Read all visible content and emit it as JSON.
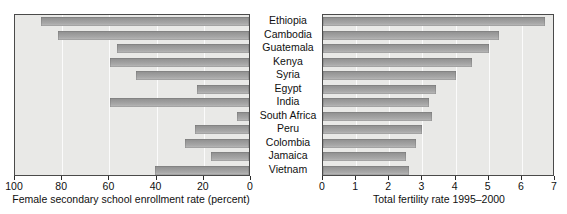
{
  "chart_data": [
    {
      "type": "bar",
      "orientation": "horizontal",
      "id": "female-enrollment",
      "title": "",
      "xlabel": "Female secondary school enrollment rate (percent)",
      "ylabel": "",
      "xlim": [
        100,
        0
      ],
      "reversed_x": true,
      "grid": true,
      "legend": "none",
      "xticks": [
        100,
        80,
        60,
        40,
        20,
        0
      ],
      "xticklabels": [
        "100",
        "80",
        "60",
        "40",
        "20",
        "0"
      ],
      "categories": [
        "Ethiopia",
        "Cambodia",
        "Guatemala",
        "Kenya",
        "Syria",
        "Egypt",
        "India",
        "South Africa",
        "Peru",
        "Colombia",
        "Jamaica",
        "Vietnam"
      ],
      "values": [
        12,
        19,
        44,
        41,
        52,
        78,
        41,
        95,
        77,
        73,
        84,
        60
      ]
    },
    {
      "type": "bar",
      "orientation": "horizontal",
      "id": "total-fertility",
      "title": "",
      "xlabel": "Total fertility rate 1995–2000",
      "ylabel": "",
      "xlim": [
        0,
        7
      ],
      "reversed_x": false,
      "grid": true,
      "legend": "none",
      "xticks": [
        0,
        1,
        2,
        3,
        4,
        5,
        6,
        7
      ],
      "xticklabels": [
        "0",
        "1",
        "2",
        "3",
        "4",
        "5",
        "6",
        "7"
      ],
      "categories": [
        "Ethiopia",
        "Cambodia",
        "Guatemala",
        "Kenya",
        "Syria",
        "Egypt",
        "India",
        "South Africa",
        "Peru",
        "Colombia",
        "Jamaica",
        "Vietnam"
      ],
      "values": [
        6.7,
        5.3,
        5.0,
        4.5,
        4.0,
        3.4,
        3.2,
        3.3,
        3.0,
        2.8,
        2.5,
        2.6
      ]
    }
  ],
  "categories": [
    "Ethiopia",
    "Cambodia",
    "Guatemala",
    "Kenya",
    "Syria",
    "Egypt",
    "India",
    "South Africa",
    "Peru",
    "Colombia",
    "Jamaica",
    "Vietnam"
  ],
  "left_axis_title": "Female secondary school enrollment rate (percent)",
  "right_axis_title": "Total fertility rate 1995–2000",
  "colors": {
    "bar_light": "#bdbdbd",
    "bar_dark": "#8e8e8e",
    "plot_background": "#e9e9e7",
    "plot_border": "#4a4a4a",
    "gridline": "#fbfbfb",
    "text": "#101010"
  }
}
